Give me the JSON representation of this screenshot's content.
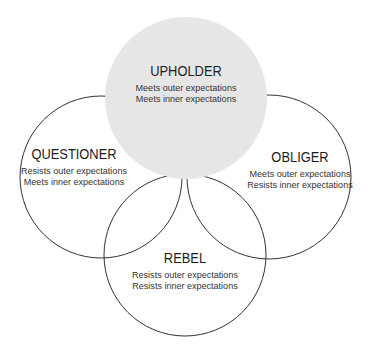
{
  "diagram": {
    "fill_color": "#e6e6e6",
    "stroke_color": "#333333",
    "circles": [
      {
        "id": "upholder",
        "title": "UPHOLDER",
        "lines": [
          "Meets outer expectations",
          "Meets inner expectations"
        ],
        "filled": true
      },
      {
        "id": "questioner",
        "title": "QUESTIONER",
        "lines": [
          "Resists outer expectations",
          "Meets inner expectations"
        ],
        "filled": false
      },
      {
        "id": "obliger",
        "title": "OBLIGER",
        "lines": [
          "Meets outer expectations",
          "Resists inner expectations"
        ],
        "filled": false
      },
      {
        "id": "rebel",
        "title": "REBEL",
        "lines": [
          "Resists outer expectations",
          "Resists inner expectations"
        ],
        "filled": false
      }
    ]
  }
}
